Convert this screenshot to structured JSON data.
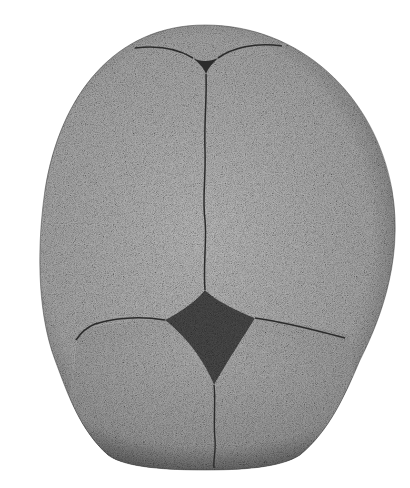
{
  "image": {
    "subject": "infant skull, superior view",
    "background_color": "#ffffff",
    "bone_color": "#a9a9a9",
    "edge_shade_color": "#3a3a3a",
    "suture_color": "#2b2b2b",
    "fontanelle_color": "#4a4a4a",
    "features": [
      {
        "name": "frontal-bones"
      },
      {
        "name": "parietal-bones"
      },
      {
        "name": "anterior-fontanelle"
      },
      {
        "name": "posterior-fontanelle"
      },
      {
        "name": "sagittal-suture"
      },
      {
        "name": "coronal-suture"
      },
      {
        "name": "metopic-suture"
      }
    ]
  }
}
